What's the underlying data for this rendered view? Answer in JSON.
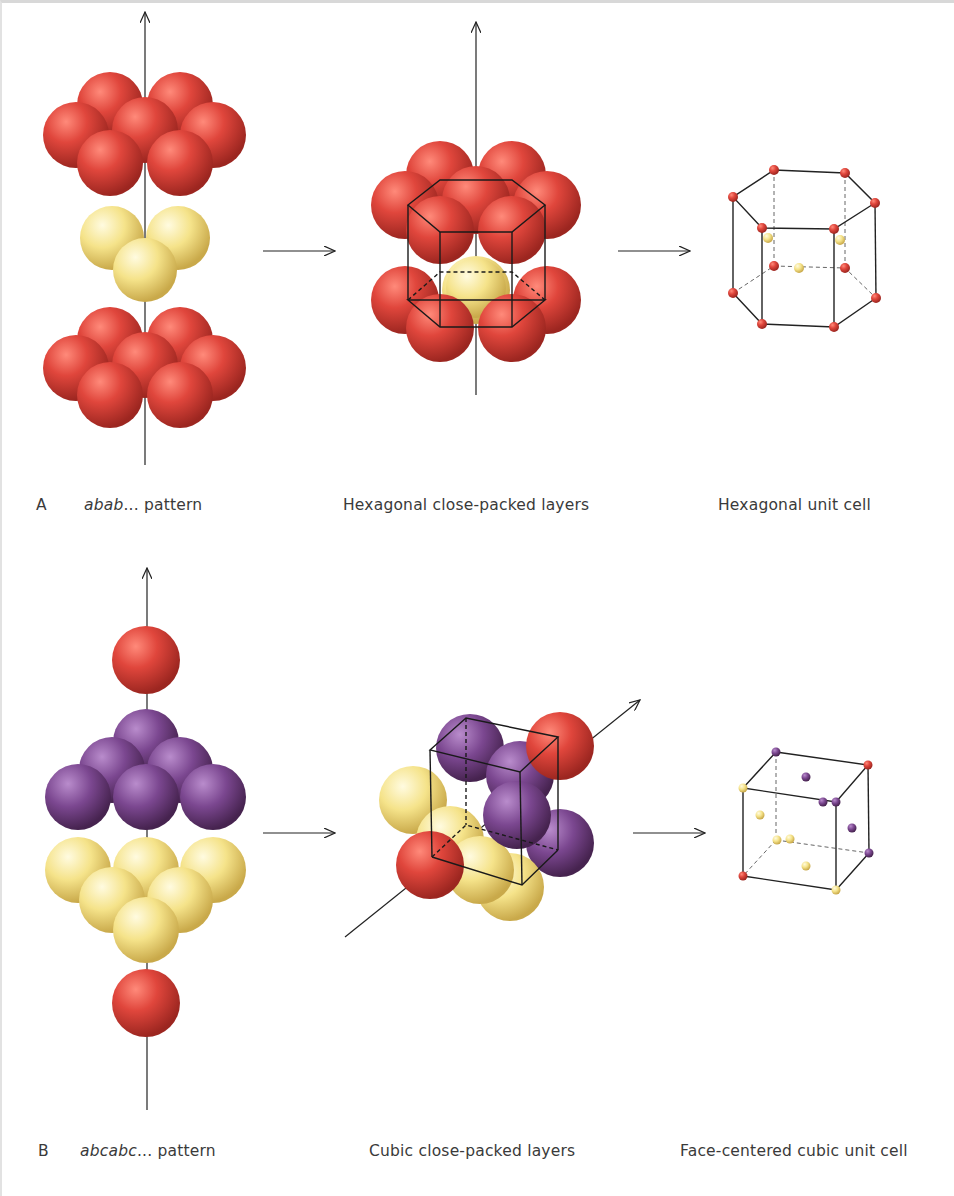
{
  "figure": {
    "panels": [
      {
        "id": "A",
        "letter": "A",
        "stacking": {
          "italic": "abab",
          "rest": "... pattern"
        },
        "middle_caption": "Hexagonal close-packed layers",
        "right_caption": "Hexagonal unit cell",
        "layers": [
          "a",
          "b",
          "a"
        ]
      },
      {
        "id": "B",
        "letter": "B",
        "stacking": {
          "italic": "abcabc",
          "rest": "... pattern"
        },
        "middle_caption": "Cubic close-packed layers",
        "right_caption": "Face-centered cubic unit cell",
        "layers": [
          "a",
          "b",
          "c",
          "a"
        ]
      }
    ],
    "colors": {
      "layer_a": "#d9453d",
      "layer_b_hcp": "#f2e07a",
      "layer_b_ccp": "#7e4a92",
      "layer_c_ccp": "#f2e07a",
      "lines": "#222222"
    },
    "icons": [
      "arrow-right-icon",
      "axis-arrow-icon"
    ]
  }
}
